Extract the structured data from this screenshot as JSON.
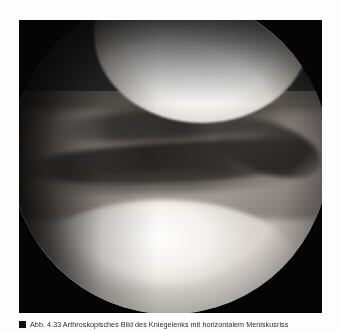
{
  "page": {
    "background_color": "#fdfdfd"
  },
  "figure": {
    "name": "arthroscopic-photograph",
    "alt_description": "Arthroscopic view of the knee joint showing the femoral condyle above and a horizontal meniscal tear below",
    "frame_color": "#050505",
    "field_of_view": "circular endoscope view",
    "regions": [
      {
        "name": "femoral-condyle",
        "tone": "bright-white"
      },
      {
        "name": "joint-space-shadow",
        "tone": "dark"
      },
      {
        "name": "meniscal-tear-cleft",
        "tone": "dark-line"
      },
      {
        "name": "meniscus-body",
        "tone": "mid-grey"
      },
      {
        "name": "tibial-cartilage",
        "tone": "bright"
      }
    ]
  },
  "caption": {
    "marker": "■",
    "number": "Abb. 4.33",
    "text": "Abb. 4.33   Arthroskopisches Bild des Kniegelenks mit horizontalem Meniskusriss"
  }
}
